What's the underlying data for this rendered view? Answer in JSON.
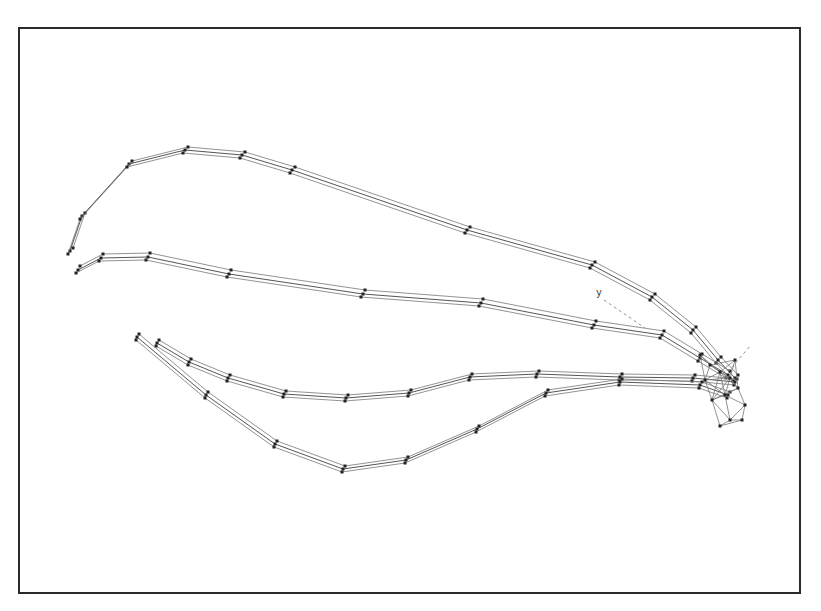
{
  "figure": {
    "label_y": "y",
    "colors": {
      "frame": "#2a2a2a",
      "vein": "#555555",
      "point": "#222222",
      "background": "#ffffff"
    }
  },
  "veins": [
    {
      "name": "costal-vein",
      "offsets": [
        [
          0,
          0
        ],
        [
          3,
          -3
        ],
        [
          -2,
          3
        ]
      ],
      "points": [
        [
          70,
          251
        ],
        [
          82,
          216
        ],
        [
          129,
          164
        ],
        [
          185,
          150
        ],
        [
          242,
          155
        ],
        [
          292,
          170
        ],
        [
          467,
          230
        ],
        [
          592,
          265
        ],
        [
          652,
          297
        ],
        [
          693,
          330
        ],
        [
          718,
          360
        ],
        [
          735,
          378
        ]
      ]
    },
    {
      "name": "radial-vein",
      "offsets": [
        [
          0,
          0
        ],
        [
          2,
          -4
        ],
        [
          -2,
          3
        ]
      ],
      "points": [
        [
          78,
          270
        ],
        [
          101,
          258
        ],
        [
          148,
          257
        ],
        [
          229,
          274
        ],
        [
          363,
          294
        ],
        [
          481,
          303
        ],
        [
          594,
          325
        ],
        [
          662,
          335
        ],
        [
          700,
          358
        ],
        [
          728,
          375
        ]
      ]
    },
    {
      "name": "medial-vein",
      "offsets": [
        [
          0,
          0
        ],
        [
          2,
          -3
        ],
        [
          -1,
          3
        ]
      ],
      "points": [
        [
          157,
          343
        ],
        [
          189,
          362
        ],
        [
          228,
          378
        ],
        [
          284,
          394
        ],
        [
          346,
          398
        ],
        [
          409,
          393
        ],
        [
          470,
          377
        ],
        [
          537,
          374
        ],
        [
          620,
          377
        ],
        [
          693,
          378
        ],
        [
          735,
          382
        ]
      ]
    },
    {
      "name": "cubital-vein",
      "offsets": [
        [
          0,
          0
        ],
        [
          2,
          -3
        ],
        [
          -1,
          3
        ]
      ],
      "points": [
        [
          137,
          337
        ],
        [
          206,
          395
        ],
        [
          275,
          444
        ],
        [
          343,
          469
        ],
        [
          406,
          460
        ],
        [
          477,
          429
        ],
        [
          546,
          393
        ],
        [
          620,
          382
        ],
        [
          700,
          385
        ],
        [
          728,
          395
        ]
      ]
    }
  ],
  "apex_cluster": {
    "points": [
      [
        700,
        355
      ],
      [
        710,
        365
      ],
      [
        720,
        372
      ],
      [
        730,
        378
      ],
      [
        738,
        388
      ],
      [
        745,
        405
      ],
      [
        742,
        420
      ],
      [
        730,
        420
      ],
      [
        720,
        426
      ],
      [
        712,
        400
      ],
      [
        705,
        380
      ],
      [
        725,
        395
      ],
      [
        735,
        360
      ]
    ]
  },
  "guide_lines": [
    {
      "name": "y-axis-guide",
      "from": [
        604,
        300
      ],
      "to": [
        645,
        328
      ]
    },
    {
      "name": "x-axis-guide",
      "from": [
        728,
        372
      ],
      "to": [
        750,
        346
      ]
    }
  ]
}
